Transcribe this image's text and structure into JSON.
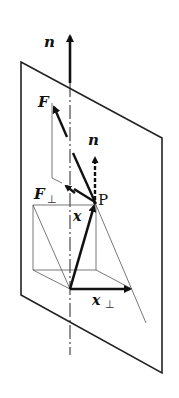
{
  "diagram": {
    "type": "vector-decomposition",
    "labels": {
      "normal_top": "n",
      "force": "F",
      "force_perp_base": "F",
      "force_perp_sub": "⊥",
      "normal_at_p": "n",
      "point": "P",
      "position": "x",
      "position_perp_base": "x",
      "position_perp_sub": "⊥"
    },
    "colors": {
      "stroke": "#111111",
      "thin": "#444444",
      "background": "#ffffff"
    }
  }
}
